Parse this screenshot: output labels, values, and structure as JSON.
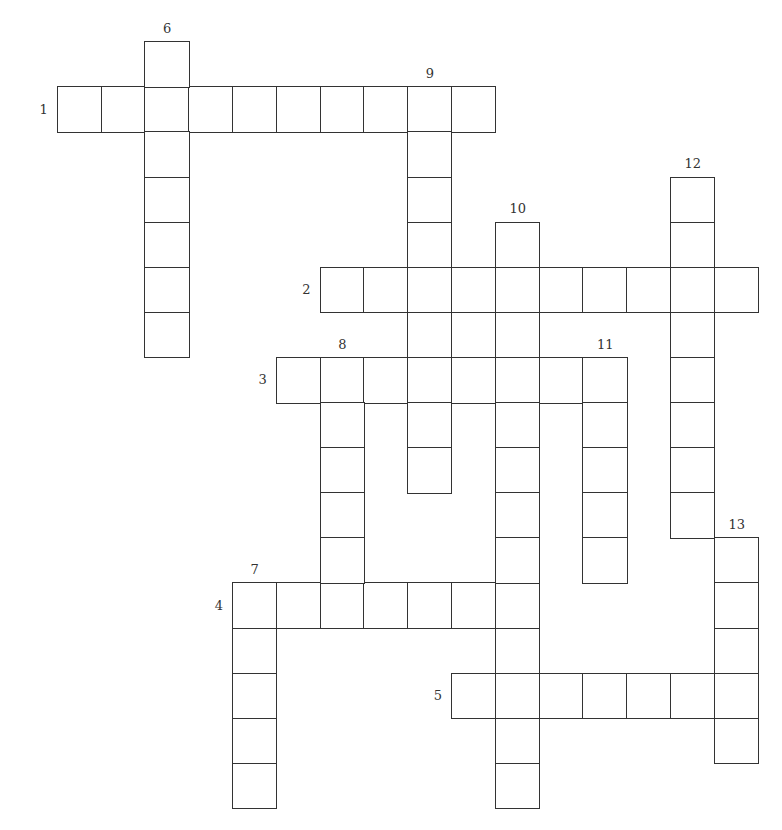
{
  "puzzle": {
    "cell": {
      "w": 43.8,
      "h": 45.1,
      "origin_x": 57.5,
      "origin_y": 42
    },
    "colors": {
      "line": "#333333",
      "background": "#ffffff",
      "number": "#333333"
    },
    "entries": [
      {
        "number": "1",
        "direction": "across",
        "row": 1,
        "col": 0,
        "length": 10,
        "label_pos": "left"
      },
      {
        "number": "2",
        "direction": "across",
        "row": 5,
        "col": 6,
        "length": 10,
        "label_pos": "left"
      },
      {
        "number": "3",
        "direction": "across",
        "row": 7,
        "col": 5,
        "length": 8,
        "label_pos": "left"
      },
      {
        "number": "4",
        "direction": "across",
        "row": 12,
        "col": 4,
        "length": 7,
        "label_pos": "left"
      },
      {
        "number": "5",
        "direction": "across",
        "row": 14,
        "col": 9,
        "length": 7,
        "label_pos": "left"
      },
      {
        "number": "6",
        "direction": "down",
        "row": 0,
        "col": 2,
        "length": 7,
        "label_pos": "top"
      },
      {
        "number": "7",
        "direction": "down",
        "row": 12,
        "col": 4,
        "length": 5,
        "label_pos": "top"
      },
      {
        "number": "8",
        "direction": "down",
        "row": 7,
        "col": 6,
        "length": 6,
        "label_pos": "top"
      },
      {
        "number": "9",
        "direction": "down",
        "row": 1,
        "col": 8,
        "length": 9,
        "label_pos": "top"
      },
      {
        "number": "10",
        "direction": "down",
        "row": 4,
        "col": 10,
        "length": 13,
        "label_pos": "top"
      },
      {
        "number": "11",
        "direction": "down",
        "row": 7,
        "col": 12,
        "length": 5,
        "label_pos": "top"
      },
      {
        "number": "12",
        "direction": "down",
        "row": 3,
        "col": 14,
        "length": 8,
        "label_pos": "top"
      },
      {
        "number": "13",
        "direction": "down",
        "row": 11,
        "col": 15,
        "length": 5,
        "label_pos": "top"
      }
    ]
  }
}
